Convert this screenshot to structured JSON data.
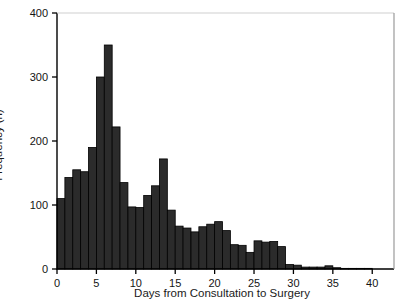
{
  "chart_data": {
    "type": "bar",
    "title": "",
    "subtitle": "",
    "xlabel": "Days from Consultation to Surgery",
    "ylabel": "Frequency (n)",
    "xlim": [
      0,
      42
    ],
    "ylim": [
      0,
      400
    ],
    "grid": false,
    "legend": null,
    "bin_width": 1,
    "bar_color": "#2b2b2b",
    "bar_edge_color": "#000000",
    "axis_color": "#000000",
    "xticks": [
      0,
      5,
      10,
      15,
      20,
      25,
      30,
      35,
      40
    ],
    "xtick_labels": [
      "0",
      "5",
      "10",
      "15",
      "20",
      "25",
      "30",
      "35",
      "40"
    ],
    "yticks": [
      0,
      100,
      200,
      300,
      400
    ],
    "ytick_labels": [
      "0",
      "100",
      "200",
      "300",
      "400"
    ],
    "bins": [
      {
        "x": 1,
        "value": 110
      },
      {
        "x": 2,
        "value": 143
      },
      {
        "x": 3,
        "value": 155
      },
      {
        "x": 4,
        "value": 152
      },
      {
        "x": 5,
        "value": 190
      },
      {
        "x": 6,
        "value": 300
      },
      {
        "x": 7,
        "value": 350
      },
      {
        "x": 8,
        "value": 222
      },
      {
        "x": 9,
        "value": 135
      },
      {
        "x": 10,
        "value": 97
      },
      {
        "x": 11,
        "value": 96
      },
      {
        "x": 12,
        "value": 115
      },
      {
        "x": 13,
        "value": 130
      },
      {
        "x": 14,
        "value": 172
      },
      {
        "x": 15,
        "value": 92
      },
      {
        "x": 16,
        "value": 67
      },
      {
        "x": 17,
        "value": 64
      },
      {
        "x": 18,
        "value": 58
      },
      {
        "x": 19,
        "value": 66
      },
      {
        "x": 20,
        "value": 70
      },
      {
        "x": 21,
        "value": 74
      },
      {
        "x": 22,
        "value": 60
      },
      {
        "x": 23,
        "value": 38
      },
      {
        "x": 24,
        "value": 37
      },
      {
        "x": 25,
        "value": 26
      },
      {
        "x": 26,
        "value": 44
      },
      {
        "x": 27,
        "value": 42
      },
      {
        "x": 28,
        "value": 43
      },
      {
        "x": 29,
        "value": 35
      },
      {
        "x": 30,
        "value": 7
      },
      {
        "x": 31,
        "value": 6
      },
      {
        "x": 32,
        "value": 3
      },
      {
        "x": 33,
        "value": 3
      },
      {
        "x": 34,
        "value": 3
      },
      {
        "x": 35,
        "value": 5
      },
      {
        "x": 36,
        "value": 2
      },
      {
        "x": 37,
        "value": 1
      },
      {
        "x": 38,
        "value": 1
      },
      {
        "x": 39,
        "value": 1
      },
      {
        "x": 40,
        "value": 1
      }
    ]
  }
}
